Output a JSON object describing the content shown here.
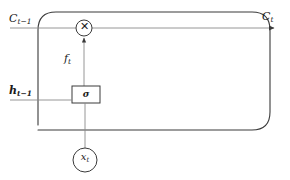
{
  "figure": {
    "type": "diagram",
    "width": 290,
    "height": 180,
    "background": "#ffffff",
    "stroke_color": "#3a3a3a",
    "text_color": "#1a1a1a"
  },
  "labels": {
    "cell_state_in": {
      "base": "C",
      "sub": "t−1",
      "text": "C t−1"
    },
    "cell_state_out": {
      "base": "C",
      "sub": "t",
      "text": "C t"
    },
    "hidden_state_in": {
      "base": "h",
      "sub": "t−1",
      "text": "h t−1"
    },
    "forget_gate": {
      "base": "f",
      "sub": "t",
      "text": "f t"
    },
    "sigmoid": "σ",
    "input": {
      "base": "x",
      "sub": "t",
      "text": "x t"
    },
    "multiply": "✕"
  },
  "nodes": [
    {
      "name": "multiply-gate",
      "shape": "circle",
      "cx": 84,
      "cy": 28,
      "r": 8,
      "glyph": "✕"
    },
    {
      "name": "sigmoid-box",
      "shape": "rect",
      "x": 72,
      "y": 86,
      "w": 28,
      "h": 17,
      "glyph": "σ"
    },
    {
      "name": "input-node",
      "shape": "circle",
      "cx": 85,
      "cy": 160,
      "r": 12,
      "glyph": "x t"
    }
  ],
  "edges": [
    {
      "name": "cell-state-line",
      "from": "C t−1",
      "to": "C t",
      "arrow": true
    },
    {
      "name": "forget-signal-line",
      "from": "σ",
      "to": "multiply-gate",
      "arrow": true
    },
    {
      "name": "input-line",
      "from": "x t",
      "to": "σ",
      "arrow": false
    },
    {
      "name": "hidden-state-line",
      "from": "h t−1",
      "to": "cell-block",
      "arrow": false
    }
  ]
}
